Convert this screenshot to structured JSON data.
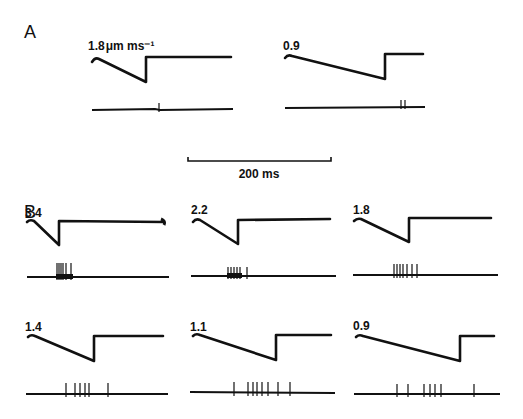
{
  "figure": {
    "panels": [
      {
        "id": "A",
        "label": "A"
      },
      {
        "id": "B",
        "label": "B"
      }
    ],
    "scale_bar": {
      "label": "200 ms"
    },
    "traces": [
      {
        "panel": "A",
        "velocity_label": "1.8",
        "unit_label": "μm ms⁻¹",
        "spike_count": 1
      },
      {
        "panel": "A",
        "velocity_label": "0.9",
        "spike_count": 2
      },
      {
        "panel": "B",
        "velocity_label": "3.4",
        "spike_count": 6
      },
      {
        "panel": "B",
        "velocity_label": "2.2",
        "spike_count": 6
      },
      {
        "panel": "B",
        "velocity_label": "1.8",
        "spike_count": 7
      },
      {
        "panel": "B",
        "velocity_label": "1.4",
        "spike_count": 6
      },
      {
        "panel": "B",
        "velocity_label": "1.1",
        "spike_count": 8
      },
      {
        "panel": "B",
        "velocity_label": "0.9",
        "spike_count": 7
      }
    ]
  }
}
